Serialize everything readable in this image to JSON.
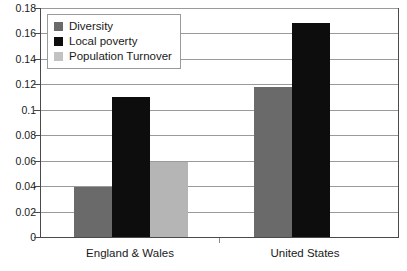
{
  "chart_data": {
    "type": "bar",
    "title": "",
    "xlabel": "",
    "ylabel": "",
    "categories": [
      "England & Wales",
      "United States"
    ],
    "series": [
      {
        "name": "Diversity",
        "color": "#6a6a6a",
        "values": [
          0.039,
          0.118
        ]
      },
      {
        "name": "Local poverty",
        "color": "#0d0d0d",
        "values": [
          0.11,
          0.168
        ]
      },
      {
        "name": "Population Turnover",
        "color": "#b5b5b5",
        "values": [
          0.059,
          null
        ]
      }
    ],
    "ylim": [
      0,
      0.18
    ],
    "ytick_step": 0.02,
    "yticks": [
      "0.18",
      "0.16",
      "0.14",
      "0.12",
      "0.1",
      "0.08",
      "0.06",
      "0.04",
      "0.02",
      "0"
    ],
    "grid": true,
    "legend_position": "top-left"
  },
  "legend": {
    "items": [
      {
        "label": "Diversity"
      },
      {
        "label": "Local poverty"
      },
      {
        "label": "Population Turnover"
      }
    ]
  },
  "axes": {
    "x_categories": [
      {
        "label": "England & Wales"
      },
      {
        "label": "United States"
      }
    ]
  }
}
